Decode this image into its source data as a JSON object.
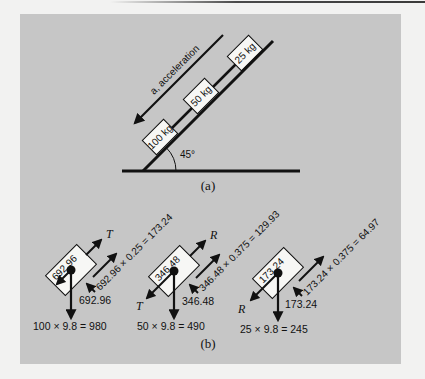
{
  "figure": {
    "part_a": {
      "caption": "(a)",
      "acceleration_label": "a, acceleration",
      "acceleration_symbol": "a",
      "angle_label": "45°",
      "blocks": [
        {
          "label": "100 kg"
        },
        {
          "label": "50 kg"
        },
        {
          "label": "25 kg"
        }
      ]
    },
    "part_b": {
      "caption": "(b)",
      "bodies": [
        {
          "box_label": "692.96",
          "normal_label": "692.96",
          "friction_label": "692.96 × 0.25 = 173.24",
          "up_slope_symbol": "T",
          "down_slope_symbol": "",
          "weight_label": "100 × 9.8 = 980"
        },
        {
          "box_label": "346.48",
          "normal_label": "346.48",
          "friction_label": "346.48 × 0.375 = 129.93",
          "up_slope_symbol": "R",
          "down_slope_symbol": "T",
          "weight_label": "50 × 9.8 = 490"
        },
        {
          "box_label": "173.24",
          "normal_label": "173.24",
          "friction_label": "173.24 × 0.375 = 64.97",
          "up_slope_symbol": "",
          "down_slope_symbol": "R",
          "weight_label": "25 × 9.8 = 245"
        }
      ]
    },
    "colors": {
      "panel": "#c6c6c6",
      "page": "#f2f2f1",
      "ink": "#111111",
      "box_fill": "#f7f7f5"
    }
  }
}
